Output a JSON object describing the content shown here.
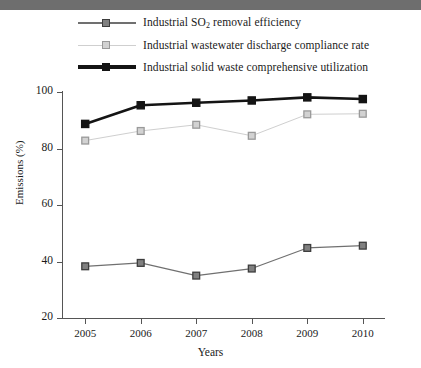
{
  "banner": {
    "name": "top-banner-strip",
    "color": "#6e6e6e"
  },
  "chart_data": {
    "type": "line",
    "title": "",
    "xlabel": "Years",
    "ylabel": "Emissions (%)",
    "categories": [
      "2005",
      "2006",
      "2007",
      "2008",
      "2009",
      "2010"
    ],
    "x": [
      2005,
      2006,
      2007,
      2008,
      2009,
      2010
    ],
    "xlim": [
      2004.6,
      2010.4
    ],
    "ylim": [
      20,
      100
    ],
    "yticks": [
      20,
      40,
      60,
      80,
      100
    ],
    "ytick_labels": [
      "20",
      "40",
      "60",
      "80",
      "100"
    ],
    "xticks": [
      2005,
      2006,
      2007,
      2008,
      2009,
      2010
    ],
    "grid": false,
    "legend_position": "top",
    "series": [
      {
        "name": "Industrial SO2 removal efficiency",
        "label_html": "Industrial SO<sub>2</sub> removal efficiency",
        "label_pre": "Industrial SO",
        "label_sub": "2",
        "label_post": " removal efficiency",
        "color": "#808080",
        "line_color": "#707070",
        "edge_color": "#3d3d3d",
        "marker": "square",
        "line_width": 1.2,
        "values": [
          38.3,
          39.5,
          35.0,
          37.5,
          44.8,
          45.6
        ]
      },
      {
        "name": "Industrial wastewater discharge compliance rate",
        "label_pre": "Industrial wastewater discharge compliance rate",
        "label_sub": "",
        "label_post": "",
        "color": "#d2d2d2",
        "line_color": "#cfcfcf",
        "edge_color": "#9a9a9a",
        "marker": "square",
        "line_width": 1.0,
        "values": [
          82.8,
          86.2,
          88.4,
          84.5,
          92.1,
          92.3
        ]
      },
      {
        "name": "Industrial solid waste comprehensive utilization",
        "label_pre": "Industrial solid waste comprehensive utilization",
        "label_sub": "",
        "label_post": "",
        "color": "#141414",
        "line_color": "#141414",
        "edge_color": "#141414",
        "marker": "square",
        "line_width": 2.6,
        "values": [
          88.7,
          95.3,
          96.2,
          97.0,
          98.1,
          97.5
        ]
      }
    ]
  }
}
